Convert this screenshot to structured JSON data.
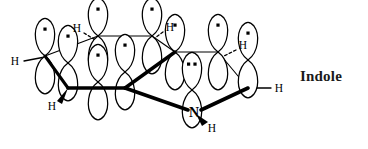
{
  "figure": {
    "title": "Indole",
    "caption_label": "Indole",
    "molecule": "indole",
    "diagram_type": "p-orbital overlap / pi system perspective drawing",
    "colors": {
      "ink": "#000000",
      "caption": "#1a1a1a",
      "background": "#ffffff",
      "orbital_fill": "#ffffff",
      "orbital_stroke": "#000000",
      "electron_dot": "#000000"
    },
    "electron_dot_shape": "square"
  },
  "orbitals": [
    {
      "id": "orbital-c7",
      "cx": 45,
      "cy": 56,
      "electrons": 1,
      "tilt": 0,
      "label": "p-orbital on C7"
    },
    {
      "id": "orbital-c6",
      "cx": 68,
      "cy": 63,
      "electrons": 1,
      "tilt": 0,
      "label": "p-orbital on C6"
    },
    {
      "id": "orbital-c7a",
      "cx": 98,
      "cy": 36,
      "electrons": 1,
      "tilt": 0,
      "label": "p-orbital on C7a"
    },
    {
      "id": "orbital-c5",
      "cx": 98,
      "cy": 82,
      "electrons": 1,
      "tilt": 0,
      "label": "p-orbital on C5"
    },
    {
      "id": "orbital-c4",
      "cx": 125,
      "cy": 72,
      "electrons": 1,
      "tilt": 0,
      "label": "p-orbital on C4"
    },
    {
      "id": "orbital-c3a",
      "cx": 152,
      "cy": 36,
      "electrons": 1,
      "tilt": 0,
      "label": "p-orbital on C3a"
    },
    {
      "id": "orbital-c3",
      "cx": 175,
      "cy": 52,
      "electrons": 1,
      "tilt": 0,
      "label": "p-orbital on C3"
    },
    {
      "id": "orbital-n1",
      "cx": 192,
      "cy": 90,
      "electrons": 2,
      "tilt": 0,
      "label": "p-orbital with lone pair on N1"
    },
    {
      "id": "orbital-c2",
      "cx": 218,
      "cy": 52,
      "electrons": 1,
      "tilt": 0,
      "label": "p-orbital on C2"
    },
    {
      "id": "orbital-c2b",
      "cx": 248,
      "cy": 60,
      "electrons": 1,
      "tilt": 0,
      "label": "p-orbital on C2 ring carbon"
    }
  ],
  "atoms": [
    {
      "id": "atom-n1",
      "symbol": "N",
      "x": 194,
      "y": 112,
      "bold": true
    }
  ],
  "hydrogens": [
    {
      "id": "h-left",
      "symbol": "H",
      "x": 15,
      "y": 64,
      "bond": "plain"
    },
    {
      "id": "h-bottom-left",
      "symbol": "H",
      "x": 52,
      "y": 107,
      "bond": "wedge"
    },
    {
      "id": "h-top-left",
      "symbol": "H",
      "x": 76,
      "y": 30,
      "bond": "dashed"
    },
    {
      "id": "h-top-right",
      "symbol": "H",
      "x": 170,
      "y": 30,
      "bond": "dashed"
    },
    {
      "id": "h-upper-right",
      "symbol": "H",
      "x": 243,
      "y": 50,
      "bond": "dashed"
    },
    {
      "id": "h-right",
      "symbol": "H",
      "x": 278,
      "y": 88,
      "bond": "plain"
    },
    {
      "id": "h-nitrogen",
      "symbol": "H",
      "x": 210,
      "y": 127,
      "bond": "wedge"
    }
  ],
  "bonds": {
    "thin": [
      {
        "id": "bond-c7-c7a",
        "x1": 45,
        "y1": 56,
        "x2": 98,
        "y2": 36
      },
      {
        "id": "bond-c7a-c3a",
        "x1": 98,
        "y1": 36,
        "x2": 152,
        "y2": 36
      },
      {
        "id": "bond-c3a-c3",
        "x1": 152,
        "y1": 36,
        "x2": 175,
        "y2": 52
      },
      {
        "id": "bond-c3-c2",
        "x1": 175,
        "y1": 52,
        "x2": 218,
        "y2": 52
      },
      {
        "id": "bond-c2-c2b",
        "x1": 218,
        "y1": 52,
        "x2": 248,
        "y2": 88
      },
      {
        "id": "bond-c7-c6",
        "x1": 45,
        "y1": 56,
        "x2": 68,
        "y2": 88
      }
    ],
    "bold": [
      {
        "id": "bond-c6-c5",
        "x1": 68,
        "y1": 88,
        "x2": 125,
        "y2": 88
      },
      {
        "id": "bond-c5-n1",
        "x1": 125,
        "y1": 88,
        "x2": 192,
        "y2": 112
      },
      {
        "id": "bond-n1-c2b",
        "x1": 192,
        "y1": 112,
        "x2": 248,
        "y2": 88
      },
      {
        "id": "bond-c5-c3",
        "x1": 125,
        "y1": 88,
        "x2": 175,
        "y2": 52
      }
    ]
  }
}
